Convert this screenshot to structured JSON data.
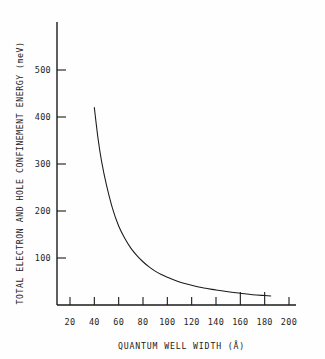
{
  "chart_data": {
    "type": "line",
    "title": "",
    "subtitle": "",
    "xlabel": "QUANTUM WELL WIDTH (Å)",
    "ylabel": "TOTAL ELECTRON AND HOLE CONFINEMENT ENERGY (meV)",
    "xlim": [
      10,
      205
    ],
    "ylim": [
      0,
      570
    ],
    "xticks": [
      20,
      40,
      60,
      80,
      100,
      120,
      140,
      160,
      180,
      200
    ],
    "xtick_labels": [
      "20",
      "40",
      "60",
      "80",
      "100",
      "120",
      "140",
      "160",
      "180",
      "200"
    ],
    "yticks": [
      100,
      200,
      300,
      400,
      500
    ],
    "ytick_labels": [
      "100",
      "200",
      "300",
      "400",
      "500"
    ],
    "grid": false,
    "legend": null,
    "legend_position": "none",
    "line_color": "#1a1a1a",
    "axis_color": "#1a1a1a",
    "background_color": "#ffffff",
    "series": [
      {
        "name": "Total confinement energy",
        "x": [
          40,
          43,
          46,
          50,
          55,
          60,
          65,
          70,
          75,
          80,
          85,
          90,
          95,
          100,
          110,
          120,
          130,
          140,
          150,
          160,
          170,
          180,
          185
        ],
        "y": [
          420,
          355,
          305,
          255,
          205,
          168,
          142,
          121,
          105,
          92,
          81,
          72,
          65,
          59,
          49,
          42,
          36,
          32,
          28,
          25,
          22,
          20,
          19
        ]
      }
    ],
    "annotations": []
  },
  "figure": {
    "note": ""
  }
}
